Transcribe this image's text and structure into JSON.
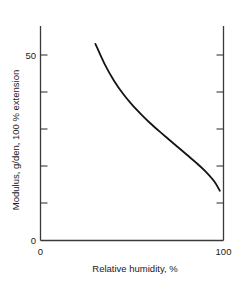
{
  "figure": {
    "background_color": "#ffffff",
    "axis_color": "#3a3a3a",
    "curve_color": "#141414"
  },
  "chart_data": {
    "type": "line",
    "title": "",
    "xlabel": "Relative humidity, %",
    "ylabel": "Modulus, g/den, 100 % extension",
    "xlim": [
      0,
      100
    ],
    "ylim": [
      0,
      60
    ],
    "xticklabels": [
      "0",
      "100"
    ],
    "xtickvalues": [
      0,
      100
    ],
    "yticklabels": [
      "0",
      "50"
    ],
    "ytickvalues": [
      0,
      50
    ],
    "yminorticks": [
      10,
      20,
      30,
      40,
      60
    ],
    "grid": false,
    "legend": null,
    "series": [
      {
        "name": "Modulus vs relative humidity",
        "x": [
          30,
          35,
          40,
          45,
          50,
          55,
          60,
          65,
          70,
          75,
          80,
          85,
          90,
          95,
          98
        ],
        "y": [
          53.0,
          47.6,
          43.2,
          39.6,
          36.6,
          34.0,
          31.6,
          29.4,
          27.3,
          25.2,
          23.1,
          21.0,
          18.7,
          15.9,
          13.4
        ]
      }
    ]
  },
  "labels": {
    "y_axis_title": "Modulus, g/den, 100 % extension",
    "x_axis_title": "Relative humidity, %",
    "y_tick_zero": "0",
    "y_tick_fifty": "50",
    "x_tick_zero": "0",
    "x_tick_hundred": "100",
    "caption_fragment": ""
  }
}
